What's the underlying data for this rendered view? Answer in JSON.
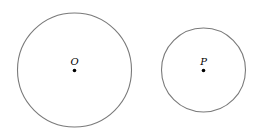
{
  "diagram": {
    "circles": [
      {
        "label": "O",
        "cx": 74.5,
        "cy": 70,
        "r": 57,
        "stroke": "#7a7a7a"
      },
      {
        "label": "P",
        "cx": 203.5,
        "cy": 70,
        "r": 42,
        "stroke": "#7a7a7a"
      }
    ],
    "center_point_color": "#000000"
  }
}
